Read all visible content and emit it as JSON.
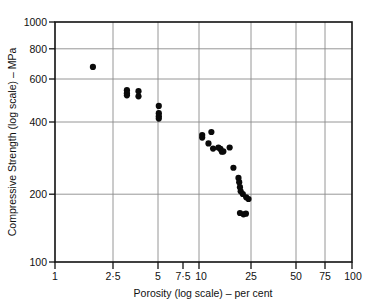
{
  "chart_data": {
    "type": "scatter",
    "title": "",
    "xlabel": "Porosity (log scale) – per cent",
    "ylabel": "Compressive Strength (log scale) – MPa",
    "xscale": "log",
    "yscale": "log",
    "xlim": [
      1,
      100
    ],
    "ylim": [
      100,
      1000
    ],
    "grid": true,
    "legend": null,
    "xticks": [
      1,
      2.5,
      5,
      7.5,
      10,
      25,
      50,
      75,
      100
    ],
    "xticklabels": [
      "1",
      "2·5",
      "5",
      "7·5",
      "10",
      "25",
      "50",
      "75",
      "100"
    ],
    "yticks": [
      100,
      200,
      400,
      600,
      800,
      1000
    ],
    "yticklabels": [
      "100",
      "200",
      "400",
      "600",
      "800",
      "1000"
    ],
    "marker": "filled-circle",
    "marker_color": "#0a0a0a",
    "series": [
      {
        "name": "Compressive strength vs porosity",
        "points": [
          [
            1.8,
            650
          ],
          [
            3.05,
            520
          ],
          [
            3.05,
            505
          ],
          [
            3.05,
            495
          ],
          [
            3.65,
            515
          ],
          [
            3.65,
            490
          ],
          [
            5.0,
            447
          ],
          [
            5.0,
            417
          ],
          [
            5.0,
            405
          ],
          [
            5.0,
            396
          ],
          [
            9.8,
            338
          ],
          [
            9.8,
            330
          ],
          [
            11.3,
            348
          ],
          [
            10.8,
            312
          ],
          [
            11.6,
            297
          ],
          [
            12.6,
            300
          ],
          [
            13.0,
            296
          ],
          [
            13.3,
            288
          ],
          [
            13.6,
            289
          ],
          [
            15.0,
            300
          ],
          [
            15.9,
            247
          ],
          [
            17.2,
            224
          ],
          [
            17.4,
            215
          ],
          [
            17.6,
            205
          ],
          [
            17.8,
            197
          ],
          [
            18.4,
            192
          ],
          [
            19.4,
            186
          ],
          [
            20.1,
            183
          ],
          [
            17.6,
            160
          ],
          [
            18.6,
            158
          ],
          [
            19.3,
            159
          ]
        ]
      }
    ]
  },
  "axes": {
    "x_title": "Porosity (log scale) – per cent",
    "y_title": "Compressive Strength (log scale) – MPa"
  }
}
